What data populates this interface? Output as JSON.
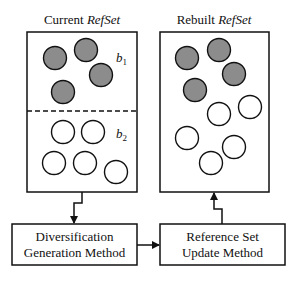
{
  "left_panel": {
    "title_prefix": "Current ",
    "title_italic": "RefSet",
    "group1_label": "b",
    "group1_sub": "1",
    "group2_label": "b",
    "group2_sub": "2",
    "filled_circles": [
      [
        55,
        58
      ],
      [
        86,
        50
      ],
      [
        101,
        75
      ],
      [
        63,
        92
      ]
    ],
    "open_circles": [
      [
        63,
        132
      ],
      [
        93,
        132
      ],
      [
        54,
        163
      ],
      [
        85,
        163
      ],
      [
        116,
        172
      ]
    ]
  },
  "right_panel": {
    "title_prefix": "Rebuilt ",
    "title_italic": "RefSet",
    "filled_circles": [
      [
        187,
        58
      ],
      [
        219,
        50
      ],
      [
        234,
        74
      ],
      [
        195,
        90
      ]
    ],
    "open_circles": [
      [
        250,
        107
      ],
      [
        219,
        114
      ],
      [
        187,
        138
      ],
      [
        234,
        147
      ],
      [
        211,
        163
      ]
    ]
  },
  "boxes": {
    "diversification": {
      "line1": "Diversification",
      "line2": "Generation Method"
    },
    "reference_update": {
      "line1": "Reference Set",
      "line2": "Update Method"
    }
  },
  "colors": {
    "filled_circle": "#8c8c8c",
    "stroke": "#111111"
  }
}
